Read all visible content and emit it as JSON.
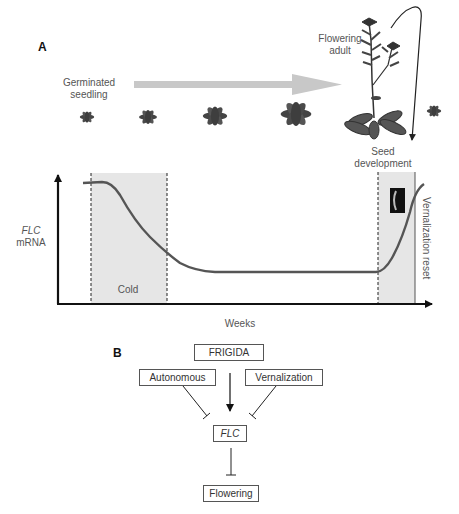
{
  "panel_a": {
    "label": "A",
    "stages": {
      "germinated_seedling": "Germinated\nseedling",
      "flowering_adult": "Flowering\nadult",
      "seed_development": "Seed\ndevelopment"
    },
    "graph": {
      "y_label_gene": "FLC",
      "y_label_unit": "mRNA",
      "x_label": "Weeks",
      "cold_label": "Cold",
      "reset_label": "Vernalization reset"
    }
  },
  "panel_b": {
    "label": "B",
    "nodes": {
      "frigida": "FRIGIDA",
      "autonomous": "Autonomous",
      "vernalization": "Vernalization",
      "flc": "FLC",
      "flowering": "Flowering"
    }
  },
  "colors": {
    "curve": "#555555",
    "shade": "#e6e6e6",
    "arrow_gray": "#c8c8c8",
    "plant": "#444444"
  }
}
